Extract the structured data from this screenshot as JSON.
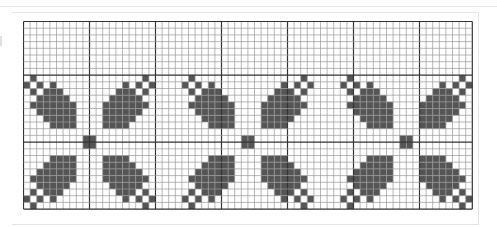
{
  "pattern": {
    "title": "",
    "cols": 68,
    "rows": 28,
    "cell_w": 6.6,
    "cell_h": 6.7,
    "major_every": 10,
    "major_row_offset": 8,
    "colors": {
      "filled": "#555555",
      "minor_line": "#9a9a9a",
      "major_line": "#333333",
      "background": "#ffffff"
    },
    "motif_centers": [
      {
        "col": 10,
        "row": 18
      },
      {
        "col": 34,
        "row": 18
      },
      {
        "col": 58,
        "row": 18
      }
    ],
    "quadrant_cells": [
      [
        1,
        1
      ],
      [
        9,
        10
      ],
      [
        10,
        9
      ],
      [
        8,
        9
      ],
      [
        9,
        8
      ],
      [
        6,
        9
      ],
      [
        9,
        6
      ],
      [
        5,
        8
      ],
      [
        6,
        8
      ],
      [
        7,
        8
      ],
      [
        8,
        7
      ],
      [
        8,
        6
      ],
      [
        8,
        5
      ],
      [
        4,
        7
      ],
      [
        5,
        7
      ],
      [
        6,
        7
      ],
      [
        7,
        7
      ],
      [
        7,
        6
      ],
      [
        7,
        5
      ],
      [
        7,
        4
      ],
      [
        3,
        6
      ],
      [
        4,
        6
      ],
      [
        5,
        6
      ],
      [
        6,
        6
      ],
      [
        6,
        5
      ],
      [
        6,
        4
      ],
      [
        6,
        3
      ],
      [
        3,
        5
      ],
      [
        4,
        5
      ],
      [
        5,
        5
      ],
      [
        5,
        4
      ],
      [
        5,
        3
      ],
      [
        3,
        4
      ],
      [
        4,
        4
      ],
      [
        4,
        3
      ],
      [
        3,
        3
      ]
    ]
  }
}
